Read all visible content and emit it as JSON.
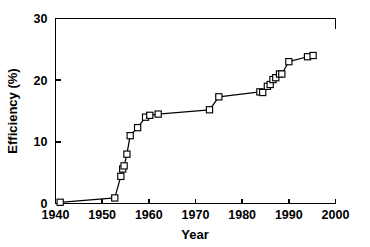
{
  "chart_data": {
    "type": "line",
    "title": "",
    "subtitle": "",
    "xlabel": "Year",
    "ylabel": "Efficiency (%)",
    "xlim": [
      1940,
      2000
    ],
    "ylim": [
      0,
      30
    ],
    "xticks": [
      1940,
      1950,
      1960,
      1970,
      1980,
      1990,
      2000
    ],
    "xtick_labels": [
      "1940",
      "1950",
      "1960",
      "1970",
      "1980",
      "1990",
      "2000"
    ],
    "yticks": [
      0,
      10,
      20,
      30
    ],
    "ytick_labels": [
      "0",
      "10",
      "20",
      "30"
    ],
    "grid": false,
    "legend": null,
    "marker": "open-square",
    "line_color": "#000000",
    "marker_face_color": "#ffffff",
    "marker_edge_color": "#000000",
    "series": [
      {
        "name": "Efficiency",
        "x": [
          1941,
          1952.7,
          1954,
          1954.4,
          1954.7,
          1955.3,
          1956,
          1957.6,
          1959.3,
          1960.2,
          1962,
          1973,
          1975,
          1983.8,
          1984.4,
          1985.4,
          1986,
          1986.6,
          1987.2,
          1988,
          1988.5,
          1990,
          1994,
          1995.2
        ],
        "y": [
          0.2,
          0.9,
          4.4,
          5.6,
          6.1,
          8.0,
          11.0,
          12.3,
          14.0,
          14.3,
          14.5,
          15.2,
          17.3,
          18.1,
          18.0,
          19.0,
          19.3,
          20.1,
          20.4,
          21.0,
          21.0,
          23.0,
          23.8,
          24.0
        ]
      }
    ]
  }
}
